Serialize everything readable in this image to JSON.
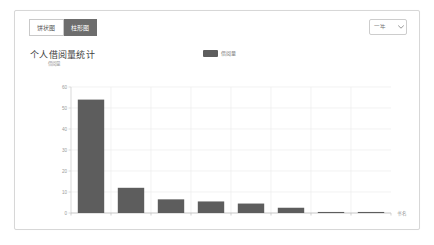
{
  "card": {
    "tabs": [
      {
        "label": "饼状图",
        "active": false,
        "name": "tab-pie-chart"
      },
      {
        "label": "柱形图",
        "active": true,
        "name": "tab-bar-chart"
      }
    ],
    "filter_select": {
      "value": "一年",
      "caret_icon": "chevron-down-icon"
    }
  },
  "chart_data": {
    "type": "bar",
    "title": "个人借阅量统计",
    "subtitle": "借阅量",
    "xlabel": "书名",
    "ylabel": "",
    "legend": [
      {
        "label": "借阅量",
        "color": "#5d5d5d"
      }
    ],
    "legend_position": "top-center",
    "grid": true,
    "ylim": [
      0,
      60
    ],
    "yticks": [
      0,
      10,
      20,
      30,
      40,
      50,
      60
    ],
    "ytick_labels": [
      "0",
      "10",
      "20",
      "30",
      "40",
      "50",
      "60"
    ],
    "categories": [
      "",
      "",
      "",
      "",
      "",
      "",
      "",
      ""
    ],
    "values": [
      54,
      12,
      6.5,
      5.5,
      4.5,
      2.5,
      0.5,
      0.5
    ],
    "bar_color": "#5d5d5d",
    "plot_background": "#ffffff",
    "grid_color": "#ededed",
    "axis_color": "#cfcfcf"
  }
}
